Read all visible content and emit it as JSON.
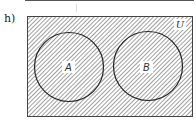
{
  "problem_label": "h)",
  "diagram": {
    "universe_label": "U",
    "sets": [
      {
        "name": "A",
        "label": "A"
      },
      {
        "name": "B",
        "label": "B"
      }
    ],
    "shaded_region": "entire universe (A, B, and complement all shaded)",
    "colors": {
      "outline": "#333333",
      "hatch": "#6e6e6e",
      "background": "#ffffff"
    }
  }
}
